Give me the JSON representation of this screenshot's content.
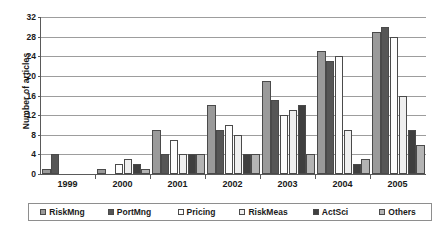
{
  "chart_data": {
    "type": "bar",
    "title": "",
    "subtitle": "",
    "xlabel": "",
    "ylabel": "Number of articles",
    "ylim": [
      0,
      32
    ],
    "ytick_step": 4,
    "yticks": [
      0,
      4,
      8,
      12,
      16,
      20,
      24,
      28,
      32
    ],
    "grid": true,
    "legend_position": "bottom",
    "categories": [
      "1999",
      "2000",
      "2001",
      "2002",
      "2003",
      "2004",
      "2005"
    ],
    "series": [
      {
        "name": "RiskMng",
        "color": "#9a9a9a",
        "values": [
          1,
          1,
          9,
          14,
          19,
          25,
          29
        ]
      },
      {
        "name": "PortMng",
        "color": "#565656",
        "values": [
          4,
          0,
          4,
          9,
          15,
          23,
          30
        ]
      },
      {
        "name": "Pricing",
        "color": "#fdfdfd",
        "values": [
          0,
          2,
          7,
          10,
          12,
          24,
          28
        ]
      },
      {
        "name": "RiskMeas",
        "color": "#efefef",
        "values": [
          0,
          3,
          4,
          8,
          13,
          9,
          16
        ]
      },
      {
        "name": "ActSci",
        "color": "#3f3f3f",
        "values": [
          0,
          2,
          4,
          4,
          14,
          2,
          9
        ]
      },
      {
        "name": "Others",
        "color": "#b4b4b4",
        "values": [
          0,
          1,
          4,
          4,
          4,
          3,
          6
        ]
      }
    ]
  },
  "axis": {
    "y_title": "Number of articles",
    "y_labels": [
      "32",
      "28",
      "24",
      "20",
      "16",
      "12",
      "8",
      "4",
      "0"
    ],
    "x_labels": [
      "1999",
      "2000",
      "2001",
      "2002",
      "2003",
      "2004",
      "2005"
    ]
  },
  "legend": {
    "items": [
      {
        "label": "RiskMng"
      },
      {
        "label": "PortMng"
      },
      {
        "label": "Pricing"
      },
      {
        "label": "RiskMeas"
      },
      {
        "label": "ActSci"
      },
      {
        "label": "Others"
      }
    ]
  }
}
